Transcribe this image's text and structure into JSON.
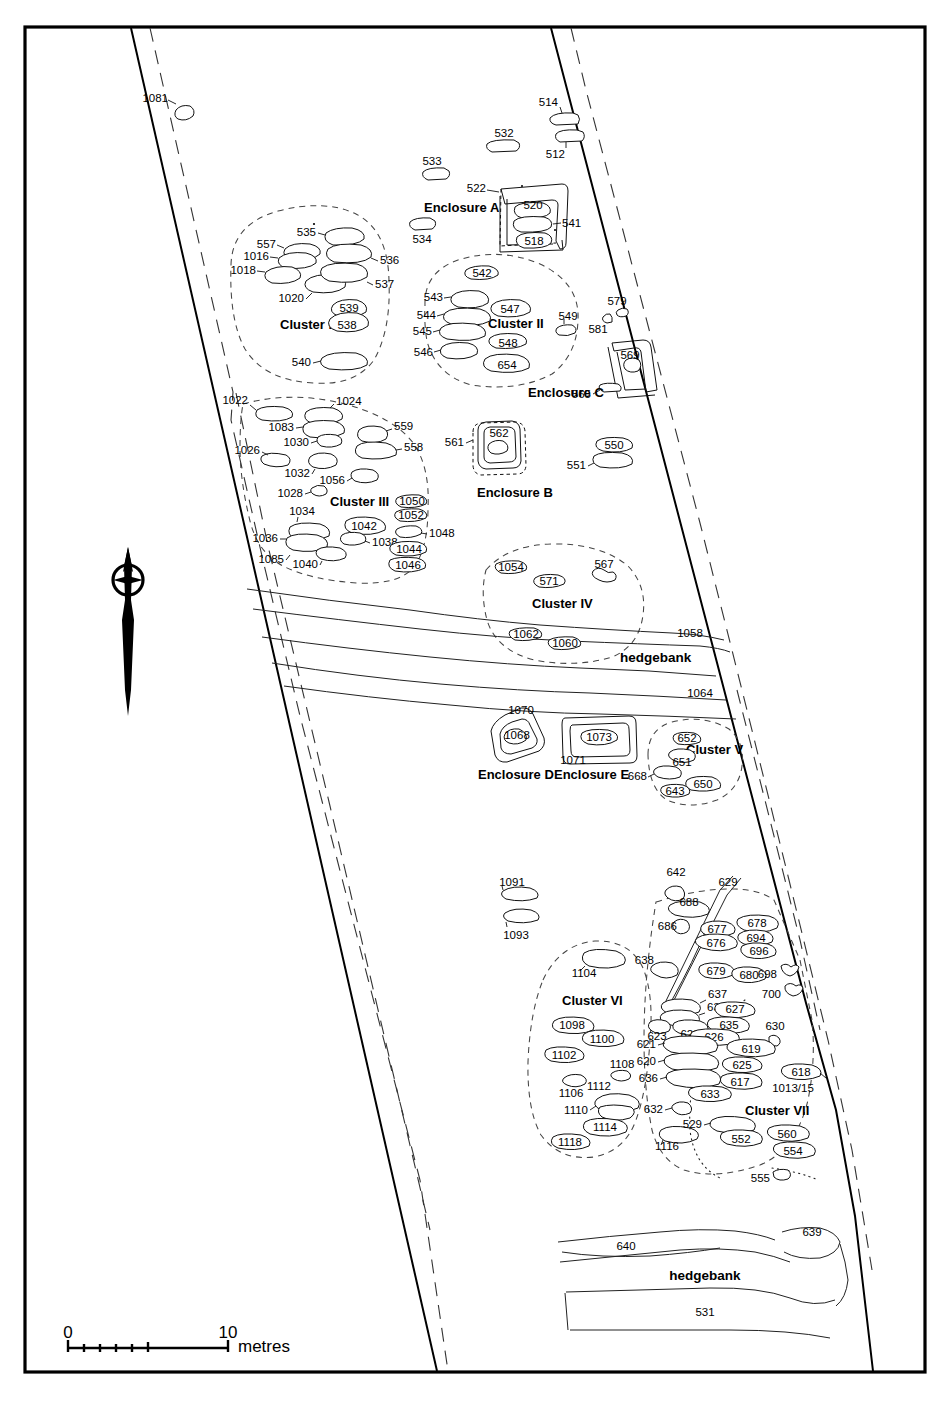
{
  "figure": {
    "type": "archaeological-site-plan",
    "north_arrow": "north-arrow-icon",
    "frame": "rectangular-border"
  },
  "scale_bar": {
    "start_label": "0",
    "end_label": "10",
    "unit_label": "metres",
    "minor_ticks": 5
  },
  "hedgebank_labels": [
    "hedgebank",
    "hedgebank"
  ],
  "cluster_labels": [
    "Cluster I",
    "Cluster II",
    "Cluster III",
    "Cluster IV",
    "Cluster V",
    "Cluster VI",
    "Cluster VII"
  ],
  "enclosure_labels": [
    "Enclosure A",
    "Enclosure B",
    "Enclosure C",
    "Enclosure D",
    "Enclosure E"
  ],
  "feature_numbers": {
    "north_field": [
      "1081",
      "514",
      "512",
      "532",
      "533",
      "534",
      "522",
      "520",
      "541",
      "518"
    ],
    "cluster_I": [
      "535",
      "557",
      "1016",
      "1018",
      "536",
      "1020",
      "537",
      "539",
      "538",
      "540"
    ],
    "cluster_II": [
      "542",
      "543",
      "547",
      "544",
      "545",
      "548",
      "546",
      "654",
      "549"
    ],
    "enclosure_C_area": [
      "579",
      "581",
      "569",
      "565"
    ],
    "cluster_III": [
      "1022",
      "1024",
      "1083",
      "559",
      "1030",
      "558",
      "1026",
      "1032",
      "1056",
      "1028",
      "1050",
      "1052",
      "1034",
      "1042",
      "1048",
      "1036",
      "1038",
      "1044",
      "1085",
      "1040",
      "1046"
    ],
    "enclosure_B_area": [
      "561",
      "562",
      "550",
      "551"
    ],
    "cluster_IV": [
      "1054",
      "571",
      "567",
      "1062",
      "1060",
      "1058",
      "1064"
    ],
    "enclosure_DE": [
      "1070",
      "1068",
      "1071",
      "1073"
    ],
    "cluster_V": [
      "652",
      "651",
      "668",
      "650",
      "643"
    ],
    "west_strip": [
      "1091",
      "1093"
    ],
    "cluster_VI": [
      "1104",
      "1098",
      "1100",
      "1102",
      "1106",
      "1112",
      "1108",
      "1110",
      "1114",
      "1118",
      "1116"
    ],
    "cluster_VII": [
      "642",
      "629",
      "688",
      "686",
      "677",
      "678",
      "694",
      "676",
      "696",
      "638",
      "679",
      "680",
      "698",
      "700",
      "637",
      "631",
      "627",
      "623",
      "628",
      "635",
      "630",
      "626",
      "621",
      "619",
      "620",
      "625",
      "618",
      "636",
      "617",
      "1013/15",
      "633",
      "632",
      "529",
      "552",
      "560",
      "554",
      "555"
    ],
    "south_field": [
      "639",
      "640",
      "531"
    ]
  },
  "colors": {
    "ink": "#000000",
    "paper": "#ffffff",
    "light_ink": "#444444"
  }
}
